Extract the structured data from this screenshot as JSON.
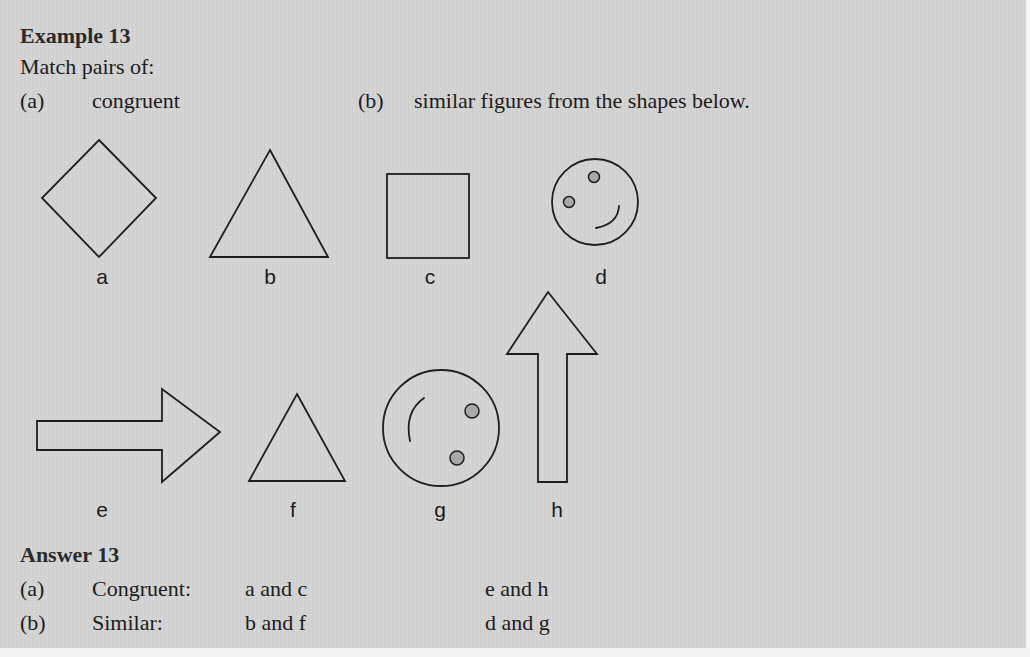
{
  "example": {
    "heading": "Example 13",
    "instruction": "Match pairs of:",
    "part_a": {
      "marker": "(a)",
      "text": "congruent"
    },
    "part_b": {
      "marker": "(b)",
      "text": "similar figures from the shapes below."
    }
  },
  "figures": [
    {
      "id": "a",
      "label": "a",
      "shape": "diamond"
    },
    {
      "id": "b",
      "label": "b",
      "shape": "triangle-large"
    },
    {
      "id": "c",
      "label": "c",
      "shape": "square"
    },
    {
      "id": "d",
      "label": "d",
      "shape": "smiley-face-small"
    },
    {
      "id": "e",
      "label": "e",
      "shape": "arrow-right"
    },
    {
      "id": "f",
      "label": "f",
      "shape": "triangle-small"
    },
    {
      "id": "g",
      "label": "g",
      "shape": "smiley-face-large-rotated"
    },
    {
      "id": "h",
      "label": "h",
      "shape": "arrow-up"
    }
  ],
  "answer": {
    "heading": "Answer 13",
    "rows": [
      {
        "marker": "(a)",
        "category": "Congruent:",
        "pair1": "a and c",
        "pair2": "e and h"
      },
      {
        "marker": "(b)",
        "category": "Similar:",
        "pair1": "b and f",
        "pair2": "d and g"
      }
    ]
  },
  "colors": {
    "page_background": "#d3d3d3",
    "ink": "#1c1c1c",
    "dot_fill": "#a9a9a9"
  }
}
